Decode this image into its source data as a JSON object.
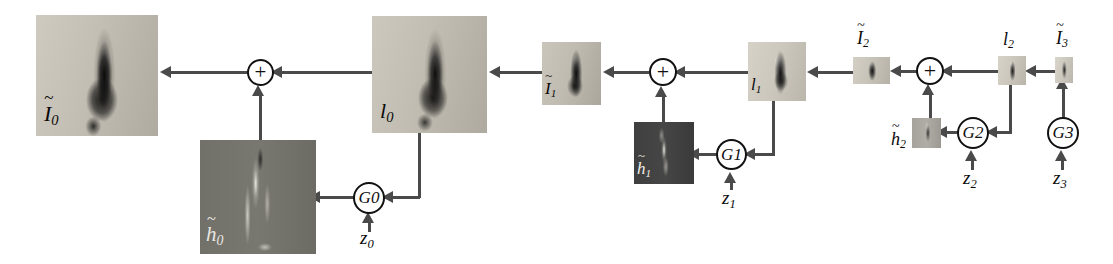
{
  "diagram": {
    "colors": {
      "stroke": "#4a4a4a",
      "node_stroke": "#111111",
      "text": "#0a0a0a",
      "background": "#ffffff",
      "photo_tile": "#b9b4ab",
      "residual_tile": "#6f6f6f"
    },
    "nodes": [
      {
        "id": "I0",
        "kind": "image",
        "label": "I",
        "sub": "0",
        "tilde": true,
        "x": 36,
        "y": 15,
        "w": 122,
        "h": 121,
        "style": "photo",
        "label_pos": "inside-bottom-left"
      },
      {
        "id": "plus0",
        "kind": "operator",
        "label": "+",
        "sub": "",
        "tilde": false,
        "x": 247,
        "y": 59,
        "w": 27,
        "h": 27,
        "style": "circle",
        "label_pos": "center"
      },
      {
        "id": "h0",
        "kind": "image",
        "label": "h",
        "sub": "0",
        "tilde": true,
        "x": 200,
        "y": 140,
        "w": 116,
        "h": 114,
        "style": "residual",
        "label_pos": "inside-bottom-left"
      },
      {
        "id": "G0",
        "kind": "operator",
        "label": "G",
        "sub": "0",
        "tilde": false,
        "x": 353,
        "y": 182,
        "w": 32,
        "h": 32,
        "style": "circle",
        "label_pos": "center"
      },
      {
        "id": "z0",
        "kind": "noise",
        "label": "z",
        "sub": "0",
        "tilde": false,
        "x": 360,
        "y": 230,
        "w": 20,
        "h": 20,
        "style": "text",
        "label_pos": "center"
      },
      {
        "id": "l0",
        "kind": "image",
        "label": "l",
        "sub": "0",
        "tilde": false,
        "x": 372,
        "y": 16,
        "w": 115,
        "h": 117,
        "style": "photo",
        "label_pos": "inside-bottom-left"
      },
      {
        "id": "I1",
        "kind": "image",
        "label": "I",
        "sub": "1",
        "tilde": true,
        "x": 542,
        "y": 42,
        "w": 59,
        "h": 63,
        "style": "photo",
        "label_pos": "inside-bottom-left"
      },
      {
        "id": "plus1",
        "kind": "operator",
        "label": "+",
        "sub": "",
        "tilde": false,
        "x": 649,
        "y": 58,
        "w": 28,
        "h": 28,
        "style": "circle",
        "label_pos": "center"
      },
      {
        "id": "h1",
        "kind": "image",
        "label": "h",
        "sub": "1",
        "tilde": true,
        "x": 634,
        "y": 122,
        "w": 60,
        "h": 62,
        "style": "residual",
        "label_pos": "inside-bottom-left"
      },
      {
        "id": "G1",
        "kind": "operator",
        "label": "G",
        "sub": "1",
        "tilde": false,
        "x": 716,
        "y": 139,
        "w": 31,
        "h": 31,
        "style": "circle",
        "label_pos": "center"
      },
      {
        "id": "z1",
        "kind": "noise",
        "label": "z",
        "sub": "1",
        "tilde": false,
        "x": 722,
        "y": 190,
        "w": 20,
        "h": 20,
        "style": "text",
        "label_pos": "center"
      },
      {
        "id": "l1",
        "kind": "image",
        "label": "l",
        "sub": "1",
        "tilde": false,
        "x": 748,
        "y": 42,
        "w": 58,
        "h": 59,
        "style": "photo",
        "label_pos": "inside-bottom-left"
      },
      {
        "id": "I2",
        "kind": "image",
        "label": "I",
        "sub": "2",
        "tilde": true,
        "x": 853,
        "y": 57,
        "w": 37,
        "h": 27,
        "style": "photo",
        "label_pos": "above"
      },
      {
        "id": "plus2",
        "kind": "operator",
        "label": "+",
        "sub": "",
        "tilde": false,
        "x": 916,
        "y": 57,
        "w": 28,
        "h": 28,
        "style": "circle",
        "label_pos": "center"
      },
      {
        "id": "h2",
        "kind": "image",
        "label": "h",
        "sub": "2",
        "tilde": true,
        "x": 912,
        "y": 118,
        "w": 29,
        "h": 30,
        "style": "residual2",
        "label_pos": "left"
      },
      {
        "id": "G2",
        "kind": "operator",
        "label": "G",
        "sub": "2",
        "tilde": false,
        "x": 957,
        "y": 117,
        "w": 32,
        "h": 32,
        "style": "circle",
        "label_pos": "center"
      },
      {
        "id": "z2",
        "kind": "noise",
        "label": "z",
        "sub": "2",
        "tilde": false,
        "x": 963,
        "y": 170,
        "w": 20,
        "h": 20,
        "style": "text",
        "label_pos": "center"
      },
      {
        "id": "l2",
        "kind": "image",
        "label": "l",
        "sub": "2",
        "tilde": false,
        "x": 998,
        "y": 56,
        "w": 28,
        "h": 29,
        "style": "photo",
        "label_pos": "above"
      },
      {
        "id": "I3",
        "kind": "image",
        "label": "I",
        "sub": "3",
        "tilde": true,
        "x": 1055,
        "y": 57,
        "w": 18,
        "h": 26,
        "style": "photo",
        "label_pos": "above"
      },
      {
        "id": "G3",
        "kind": "operator",
        "label": "G",
        "sub": "3",
        "tilde": false,
        "x": 1047,
        "y": 117,
        "w": 32,
        "h": 32,
        "style": "circle",
        "label_pos": "center"
      },
      {
        "id": "z3",
        "kind": "noise",
        "label": "z",
        "sub": "3",
        "tilde": false,
        "x": 1053,
        "y": 170,
        "w": 20,
        "h": 20,
        "style": "text",
        "label_pos": "center"
      }
    ],
    "edges": [
      {
        "from": "plus0",
        "to": "I0",
        "dir": "left"
      },
      {
        "from": "l0",
        "to": "plus0",
        "dir": "left"
      },
      {
        "from": "h0",
        "to": "plus0",
        "dir": "up"
      },
      {
        "from": "l0",
        "to": "G0",
        "dir": "left"
      },
      {
        "from": "G0",
        "to": "h0",
        "dir": "left"
      },
      {
        "from": "z0",
        "to": "G0",
        "dir": "up"
      },
      {
        "from": "I1",
        "to": "l0",
        "dir": "left"
      },
      {
        "from": "plus1",
        "to": "I1",
        "dir": "left"
      },
      {
        "from": "l1",
        "to": "plus1",
        "dir": "left"
      },
      {
        "from": "h1",
        "to": "plus1",
        "dir": "up"
      },
      {
        "from": "l1",
        "to": "G1",
        "dir": "left"
      },
      {
        "from": "G1",
        "to": "h1",
        "dir": "left"
      },
      {
        "from": "z1",
        "to": "G1",
        "dir": "up"
      },
      {
        "from": "I2",
        "to": "l1",
        "dir": "left"
      },
      {
        "from": "plus2",
        "to": "I2",
        "dir": "left"
      },
      {
        "from": "l2",
        "to": "plus2",
        "dir": "left"
      },
      {
        "from": "h2",
        "to": "plus2",
        "dir": "up"
      },
      {
        "from": "l2",
        "to": "G2",
        "dir": "left"
      },
      {
        "from": "G2",
        "to": "h2",
        "dir": "left"
      },
      {
        "from": "z2",
        "to": "G2",
        "dir": "up"
      },
      {
        "from": "I3",
        "to": "l2",
        "dir": "left"
      },
      {
        "from": "G3",
        "to": "I3",
        "dir": "up"
      },
      {
        "from": "z3",
        "to": "G3",
        "dir": "up"
      }
    ]
  },
  "labels": {
    "I0": {
      "base": "I",
      "sub": "0",
      "tilde": true
    },
    "h0": {
      "base": "h",
      "sub": "0",
      "tilde": true
    },
    "l0": {
      "base": "l",
      "sub": "0",
      "tilde": false
    },
    "z0": {
      "base": "z",
      "sub": "0",
      "tilde": false
    },
    "G0": {
      "base": "G",
      "sub": "0",
      "tilde": false
    },
    "I1": {
      "base": "I",
      "sub": "1",
      "tilde": true
    },
    "h1": {
      "base": "h",
      "sub": "1",
      "tilde": true
    },
    "l1": {
      "base": "l",
      "sub": "1",
      "tilde": false
    },
    "z1": {
      "base": "z",
      "sub": "1",
      "tilde": false
    },
    "G1": {
      "base": "G",
      "sub": "1",
      "tilde": false
    },
    "I2": {
      "base": "I",
      "sub": "2",
      "tilde": true
    },
    "h2": {
      "base": "h",
      "sub": "2",
      "tilde": true
    },
    "l2": {
      "base": "l",
      "sub": "2",
      "tilde": false
    },
    "z2": {
      "base": "z",
      "sub": "2",
      "tilde": false
    },
    "G2": {
      "base": "G",
      "sub": "2",
      "tilde": false
    },
    "I3": {
      "base": "I",
      "sub": "3",
      "tilde": true
    },
    "z3": {
      "base": "z",
      "sub": "3",
      "tilde": false
    },
    "G3": {
      "base": "G",
      "sub": "3",
      "tilde": false
    },
    "plus": "+",
    "tilde_glyph": "~"
  }
}
